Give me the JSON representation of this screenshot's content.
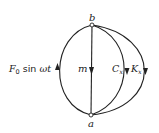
{
  "diagram": {
    "type": "mechanical network graph",
    "nodes": [
      {
        "id": "b",
        "label": "b"
      },
      {
        "id": "a",
        "label": "a"
      }
    ],
    "edges": [
      {
        "id": "force",
        "label_F": "F",
        "label_sub": "0",
        "label_rest": " sin ",
        "label_omega": "ωt",
        "direction": "a-to-b"
      },
      {
        "id": "mass",
        "label": "m",
        "direction": "b-to-a"
      },
      {
        "id": "damper",
        "label": "C",
        "label_sub": "x",
        "direction": "b-to-a"
      },
      {
        "id": "spring",
        "label": "K",
        "label_sub": "x",
        "direction": "b-to-a"
      }
    ]
  },
  "colors": {
    "stroke": "#222222",
    "background": "#ffffff"
  }
}
